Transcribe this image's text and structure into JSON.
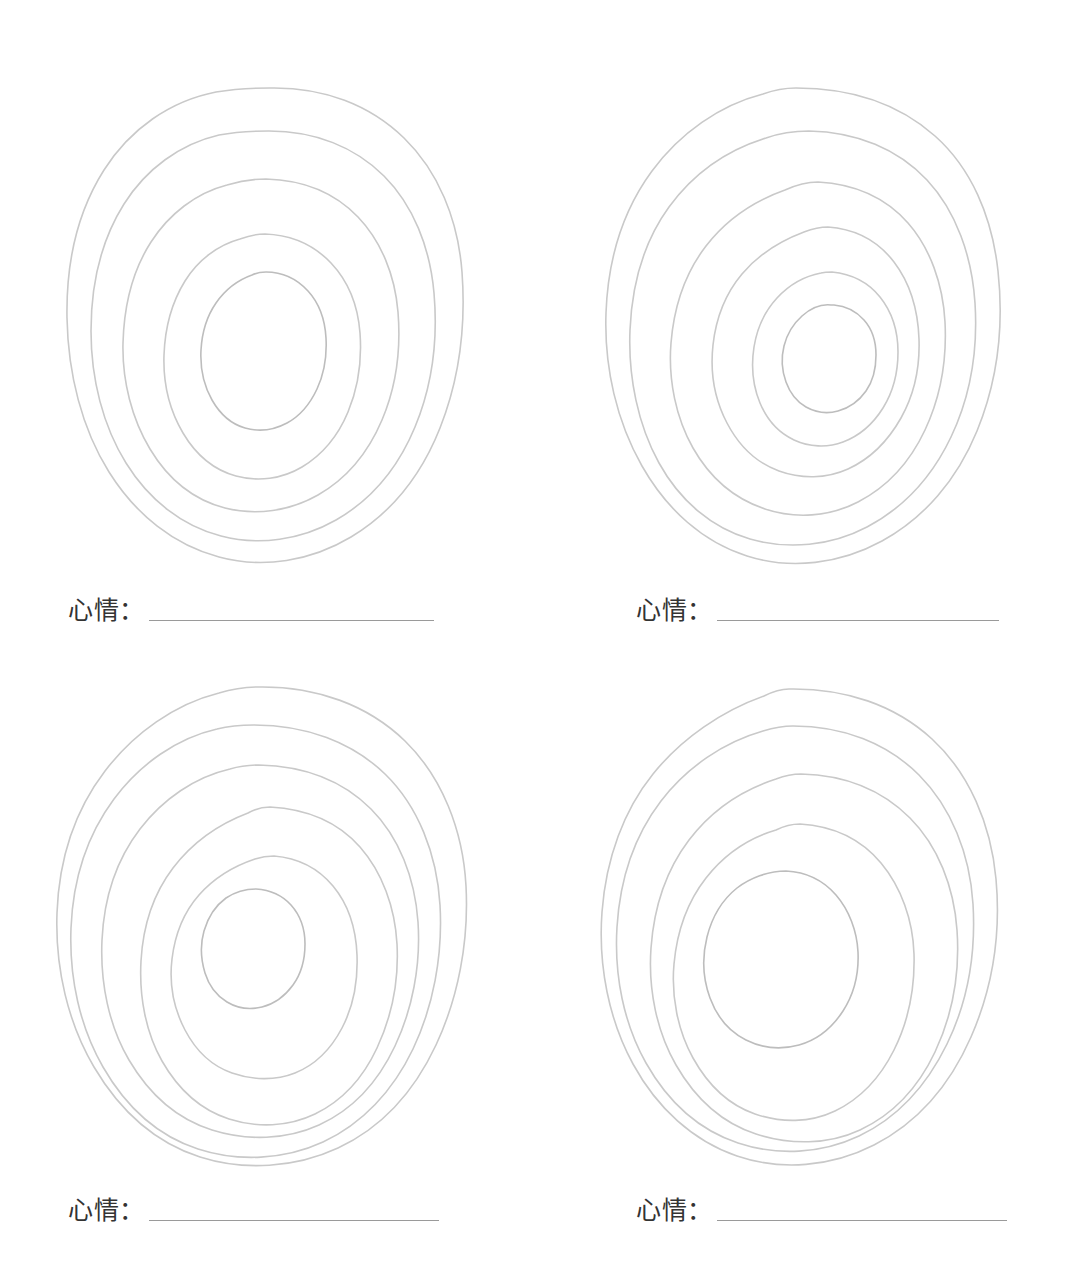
{
  "document": {
    "title": "心情圆环练习单",
    "background_color": "#ffffff",
    "ink_color": "#c9c9c9",
    "text_color": "#333333",
    "line_color": "#9a9a9a",
    "page_width": 1071,
    "page_height": 1274
  },
  "panels": [
    {
      "id": "panel-1",
      "position": "top-left",
      "label": "心情：",
      "value": "",
      "ring_count": 5,
      "drawing": "hand-drawn-concentric-rings"
    },
    {
      "id": "panel-2",
      "position": "top-right",
      "label": "心情：",
      "value": "",
      "ring_count": 5,
      "drawing": "hand-drawn-concentric-rings"
    },
    {
      "id": "panel-3",
      "position": "bottom-left",
      "label": "心情：",
      "value": "",
      "ring_count": 5,
      "drawing": "hand-drawn-concentric-rings"
    },
    {
      "id": "panel-4",
      "position": "bottom-right",
      "label": "心情：",
      "value": "",
      "ring_count": 5,
      "drawing": "hand-drawn-concentric-rings"
    }
  ]
}
